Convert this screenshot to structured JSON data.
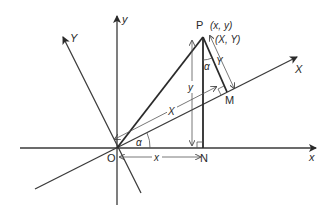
{
  "diagram": {
    "colors": {
      "line": "#2a2a2a",
      "background": "#ffffff"
    },
    "points": {
      "P": {
        "label": "P",
        "coords_original": "(x, y)",
        "coords_rotated": "(X, Y)"
      },
      "O": {
        "label": "O"
      },
      "N": {
        "label": "N"
      },
      "M": {
        "label": "M"
      }
    },
    "axes": {
      "x": "x",
      "y": "y",
      "X": "X",
      "Y": "Y"
    },
    "measures": {
      "on_x_axis": "x",
      "vertical_PN": "y",
      "along_X_axis": "X",
      "perp_PM": "Y"
    },
    "angles": {
      "at_O": "α",
      "at_P": "α"
    }
  }
}
